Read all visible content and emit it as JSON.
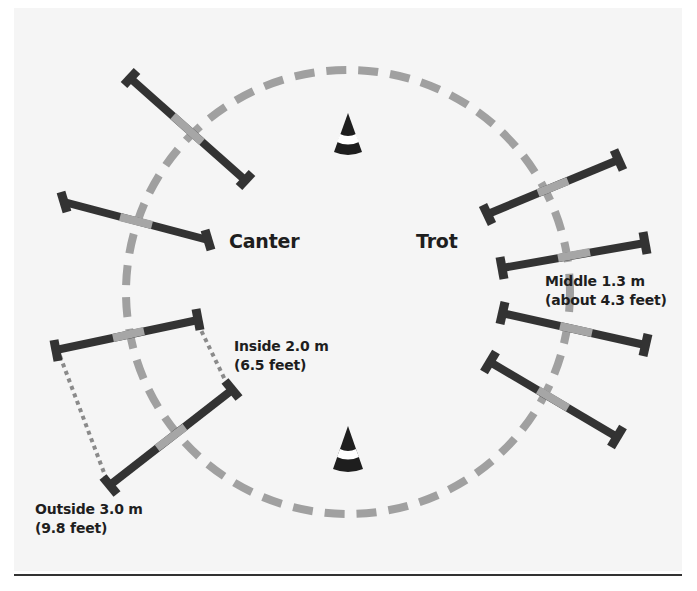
{
  "diagram": {
    "labels": {
      "canter": "Canter",
      "trot": "Trot",
      "inside_line1": "Inside 2.0 m",
      "inside_line2": "(6.5 feet)",
      "outside_line1": "Outside 3.0 m",
      "outside_line2": "(9.8 feet)",
      "middle_line1": "Middle 1.3 m",
      "middle_line2": "(about 4.3 feet)"
    },
    "circle": {
      "cx": 348,
      "cy": 292,
      "r": 222,
      "style": "dashed",
      "color": "#a0a0a0"
    },
    "cones": [
      {
        "name": "top-cone",
        "x": 348,
        "y": 113
      },
      {
        "name": "bottom-cone",
        "x": 348,
        "y": 426
      }
    ],
    "poles": {
      "canter_side": [
        {
          "x1": 130,
          "y1": 78,
          "x2": 245,
          "y2": 180
        },
        {
          "x1": 64,
          "y1": 202,
          "x2": 208,
          "y2": 240
        },
        {
          "x1": 56,
          "y1": 350,
          "x2": 198,
          "y2": 320
        },
        {
          "x1": 110,
          "y1": 485,
          "x2": 232,
          "y2": 390
        }
      ],
      "trot_side": [
        {
          "x1": 488,
          "y1": 214,
          "x2": 618,
          "y2": 160
        },
        {
          "x1": 502,
          "y1": 268,
          "x2": 645,
          "y2": 243
        },
        {
          "x1": 502,
          "y1": 313,
          "x2": 645,
          "y2": 345
        },
        {
          "x1": 490,
          "y1": 362,
          "x2": 617,
          "y2": 437
        }
      ]
    },
    "distance_markers": [
      {
        "name": "inside-distance",
        "x1": 198,
        "y1": 320,
        "x2": 232,
        "y2": 390
      },
      {
        "name": "outside-distance",
        "x1": 56,
        "y1": 350,
        "x2": 110,
        "y2": 485
      }
    ],
    "colors": {
      "pole": "#333333",
      "pole_center": "#a6a6a6",
      "circle": "#a0a0a0",
      "cone": "#1e1e1e",
      "background": "#f5f5f5",
      "text": "#1e1e1e"
    }
  }
}
